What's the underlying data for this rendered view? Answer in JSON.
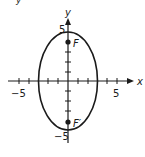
{
  "figure": {
    "type": "ellipse-graph",
    "equation_hint": "x^2/9 + y^2/25 = 1",
    "axes": {
      "x_label": "x",
      "y_label": "y",
      "x_tick_labels": {
        "neg": "−5",
        "pos": "5"
      },
      "y_tick_labels": {
        "pos": "5",
        "neg": "−5"
      },
      "x_range": [
        -5,
        5
      ],
      "y_range": [
        -5,
        5
      ]
    },
    "ellipse": {
      "center": [
        0,
        0
      ],
      "semi_axis_x": 3,
      "semi_axis_y": 5,
      "color": "#1a1a1a"
    },
    "foci": [
      {
        "label": "F",
        "x": 0,
        "y": 4
      },
      {
        "label": "F′",
        "x": 0,
        "y": -4
      }
    ],
    "top_fragment": "y"
  }
}
